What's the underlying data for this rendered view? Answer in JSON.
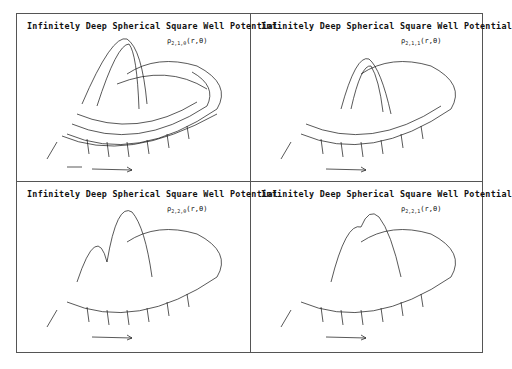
{
  "figure": {
    "panels": [
      {
        "title": "Infinitely Deep Spherical Square Well Potential",
        "label_symbol": "ρ",
        "label_sub": "2,1,0",
        "label_args": "(r,θ)",
        "axis_r": "r",
        "axis_theta": "θ"
      },
      {
        "title": "Infinitely Deep Spherical Square Well Potential",
        "label_symbol": "ρ",
        "label_sub": "2,1,1",
        "label_args": "(r,θ)",
        "axis_r": "r",
        "axis_theta": "θ"
      },
      {
        "title": "Infinitely Deep Spherical Square Well Potential",
        "label_symbol": "ρ",
        "label_sub": "2,2,0",
        "label_args": "(r,θ)",
        "axis_r": "r",
        "axis_theta": "θ"
      },
      {
        "title": "Infinitely Deep Spherical Square Well Potential",
        "label_symbol": "ρ",
        "label_sub": "2,2,1",
        "label_args": "(r,θ)",
        "axis_r": "r",
        "axis_theta": "θ"
      }
    ]
  }
}
